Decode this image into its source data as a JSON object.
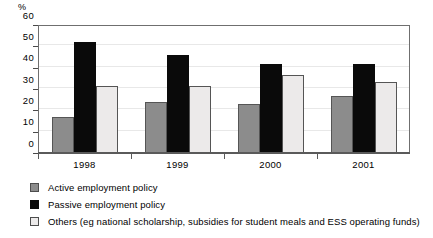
{
  "chart_data": {
    "type": "bar",
    "title": "",
    "subtitle": "",
    "xlabel": "",
    "ylabel": "%",
    "ylim": [
      0,
      60
    ],
    "ytick_labels": [
      "0",
      "10",
      "20",
      "30",
      "40",
      "50",
      "60"
    ],
    "ytick_values": [
      0,
      10,
      20,
      30,
      40,
      50,
      60
    ],
    "grid": true,
    "legend_position": "below",
    "categories": [
      "1998",
      "1999",
      "2000",
      "2001"
    ],
    "series": [
      {
        "name": "Active employment policy",
        "color": "#8c8c8c",
        "values": [
          17,
          24,
          23,
          26.5
        ]
      },
      {
        "name": "Passive employment policy",
        "color": "#0a0a0a",
        "values": [
          52,
          46,
          41.5,
          41.5
        ]
      },
      {
        "name": "Others (eg national scholarship, subsidies for student meals and ESS operating funds)",
        "color": "#eceaea",
        "values": [
          31.5,
          31.5,
          36.5,
          33.5
        ]
      }
    ]
  }
}
